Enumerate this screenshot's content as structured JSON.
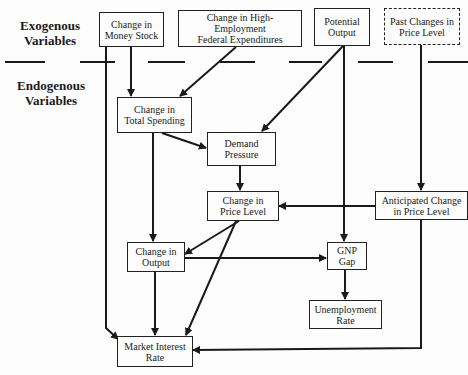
{
  "labels": {
    "exogenous": [
      "Exogenous",
      "Variables"
    ],
    "endogenous": [
      "Endogenous",
      "Variables"
    ]
  },
  "nodes": {
    "money_stock": [
      "Change in",
      "Money Stock"
    ],
    "fed_expenditures": [
      "Change in High-Employment",
      "Federal Expenditures"
    ],
    "potential_output": [
      "Potential",
      "Output"
    ],
    "past_price_changes": [
      "Past Changes in",
      "Price Level"
    ],
    "total_spending": [
      "Change in",
      "Total Spending"
    ],
    "demand_pressure": [
      "Demand",
      "Pressure"
    ],
    "price_level": [
      "Change in",
      "Price Level"
    ],
    "anticipated_price": [
      "Anticipated Change",
      "in Price Level"
    ],
    "output": [
      "Change in",
      "Output"
    ],
    "gnp_gap": [
      "GNP",
      "Gap"
    ],
    "unemployment": [
      "Unemployment",
      "Rate"
    ],
    "interest_rate": [
      "Market Interest",
      "Rate"
    ]
  },
  "edges": [
    {
      "from": "Change in Money Stock",
      "to": "Change in Total Spending"
    },
    {
      "from": "Change in Money Stock",
      "to": "Market Interest Rate"
    },
    {
      "from": "Change in High-Employment Federal Expenditures",
      "to": "Change in Total Spending"
    },
    {
      "from": "Potential Output",
      "to": "Demand Pressure"
    },
    {
      "from": "Potential Output",
      "to": "GNP Gap"
    },
    {
      "from": "Past Changes in Price Level",
      "to": "Anticipated Change in Price Level"
    },
    {
      "from": "Change in Total Spending",
      "to": "Demand Pressure"
    },
    {
      "from": "Change in Total Spending",
      "to": "Change in Output"
    },
    {
      "from": "Demand Pressure",
      "to": "Change in Price Level"
    },
    {
      "from": "Anticipated Change in Price Level",
      "to": "Change in Price Level"
    },
    {
      "from": "Anticipated Change in Price Level",
      "to": "Market Interest Rate"
    },
    {
      "from": "Change in Price Level",
      "to": "Change in Output"
    },
    {
      "from": "Change in Price Level",
      "to": "Market Interest Rate"
    },
    {
      "from": "Change in Output",
      "to": "GNP Gap"
    },
    {
      "from": "Change in Output",
      "to": "Market Interest Rate"
    },
    {
      "from": "GNP Gap",
      "to": "Unemployment Rate"
    }
  ]
}
